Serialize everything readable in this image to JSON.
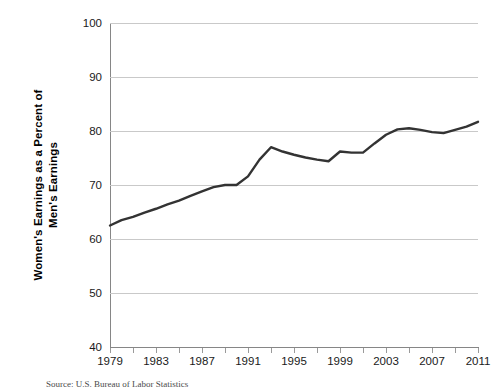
{
  "chart_data": {
    "type": "line",
    "title": "",
    "subtitle": "",
    "xlabel": "",
    "ylabel": "Women's Earnings as a Percent of Men's Earnings",
    "ylabel_line1": "Women's Earnings as a Percent of",
    "ylabel_line2": "Men's Earnings",
    "xlim": [
      1979,
      2011
    ],
    "ylim": [
      40,
      100
    ],
    "y_ticks": [
      40,
      50,
      60,
      70,
      80,
      90,
      100
    ],
    "y_tick_labels": [
      "40",
      "50",
      "60",
      "70",
      "80",
      "90",
      "100"
    ],
    "x_ticks": [
      1979,
      1981,
      1983,
      1985,
      1987,
      1989,
      1991,
      1993,
      1995,
      1997,
      1999,
      2001,
      2003,
      2005,
      2007,
      2009,
      2011
    ],
    "x_tick_labels": [
      "1979",
      "1983",
      "1987",
      "1991",
      "1995",
      "1999",
      "2003",
      "2007",
      "2011"
    ],
    "x_labeled_ticks": [
      1979,
      1983,
      1987,
      1991,
      1995,
      1999,
      2003,
      2007,
      2011
    ],
    "grid": true,
    "grid_axis": "y",
    "legend": false,
    "legend_position": "none",
    "line_color": "#333333",
    "grid_color": "#c9c9c9",
    "axis_color": "#868686",
    "background_color": "#ffffff",
    "x": [
      1979,
      1980,
      1981,
      1982,
      1983,
      1984,
      1985,
      1986,
      1987,
      1988,
      1989,
      1990,
      1991,
      1992,
      1993,
      1994,
      1995,
      1996,
      1997,
      1998,
      1999,
      2000,
      2001,
      2002,
      2003,
      2004,
      2005,
      2006,
      2007,
      2008,
      2009,
      2010,
      2011
    ],
    "values": [
      62.5,
      63.5,
      64.1,
      64.9,
      65.6,
      66.4,
      67.1,
      68.0,
      68.8,
      69.6,
      70.0,
      70.0,
      71.6,
      74.7,
      77.0,
      76.2,
      75.6,
      75.1,
      74.7,
      74.4,
      76.2,
      76.0,
      76.0,
      77.7,
      79.3,
      80.3,
      80.5,
      80.2,
      79.8,
      79.6,
      80.2,
      80.8,
      81.7
    ],
    "series": [
      {
        "name": "Women's earnings as a percent of men's earnings",
        "values": [
          62.5,
          63.5,
          64.1,
          64.9,
          65.6,
          66.4,
          67.1,
          68.0,
          68.8,
          69.6,
          70.0,
          70.0,
          71.6,
          74.7,
          77.0,
          76.2,
          75.6,
          75.1,
          74.7,
          74.4,
          76.2,
          76.0,
          76.0,
          77.7,
          79.3,
          80.3,
          80.5,
          80.2,
          79.8,
          79.6,
          80.2,
          80.8,
          81.7
        ]
      }
    ]
  },
  "source": {
    "note": "Source:  U.S. Bureau of Labor Statistics"
  }
}
